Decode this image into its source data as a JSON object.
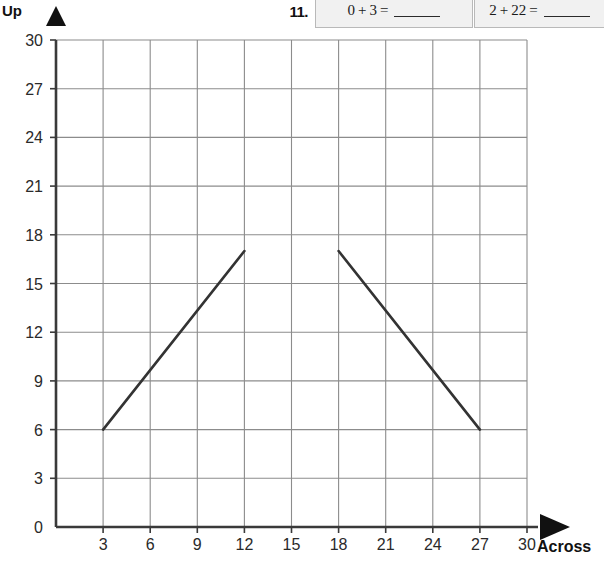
{
  "worksheet": {
    "problem_number": "11.",
    "problems": [
      {
        "left": "0",
        "operator": "+",
        "right": "3",
        "equals": "="
      },
      {
        "left": "2",
        "operator": "+",
        "right": "22",
        "equals": "="
      }
    ]
  },
  "axes": {
    "y_label": "Up",
    "x_label": "Across",
    "y_ticks": [
      "30",
      "27",
      "24",
      "21",
      "18",
      "15",
      "12",
      "9",
      "6",
      "3",
      "0"
    ],
    "x_ticks": [
      "3",
      "6",
      "9",
      "12",
      "15",
      "18",
      "21",
      "24",
      "27",
      "30"
    ]
  },
  "chart_data": {
    "type": "line",
    "title": "",
    "xlabel": "Across",
    "ylabel": "Up",
    "xlim": [
      0,
      30
    ],
    "ylim": [
      0,
      30
    ],
    "xticks": [
      3,
      6,
      9,
      12,
      15,
      18,
      21,
      24,
      27,
      30
    ],
    "yticks": [
      0,
      3,
      6,
      9,
      12,
      15,
      18,
      21,
      24,
      27,
      30
    ],
    "grid": true,
    "legend": "none",
    "line_color": "#333333",
    "grid_color": "#8c8c8c",
    "series": [
      {
        "name": "ascending-segment",
        "points": [
          [
            3,
            6
          ],
          [
            12,
            17
          ]
        ]
      },
      {
        "name": "descending-segment",
        "points": [
          [
            18,
            17
          ],
          [
            27,
            6
          ]
        ]
      }
    ]
  }
}
